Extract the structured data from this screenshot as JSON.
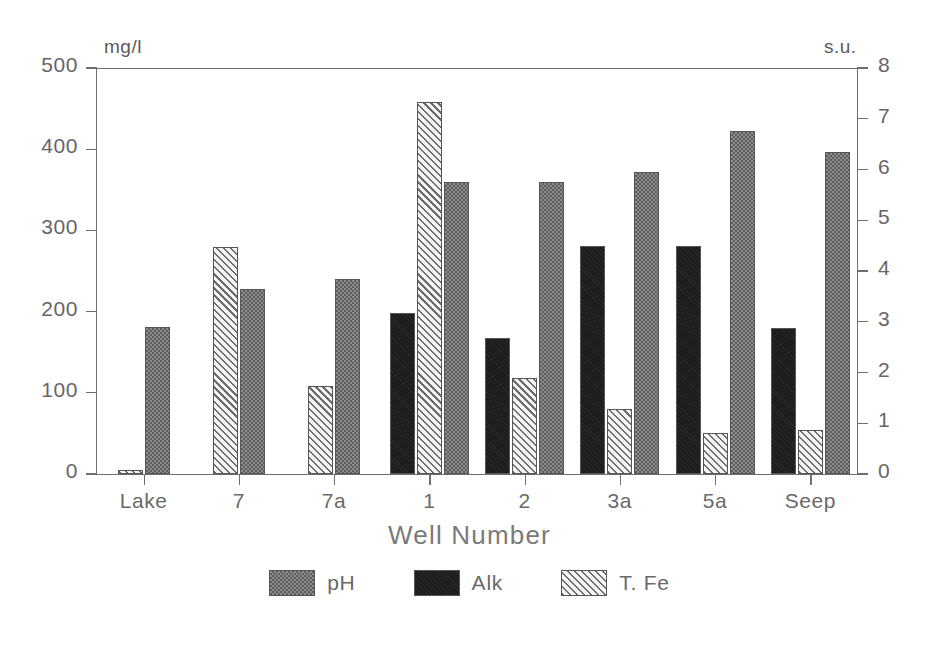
{
  "chart_data": {
    "type": "bar",
    "title": "",
    "xlabel": "Well Number",
    "left_axis": {
      "unit_label": "mg/l",
      "ticks": [
        0,
        100,
        200,
        300,
        400,
        500
      ],
      "ylim": [
        0,
        500
      ]
    },
    "right_axis": {
      "unit_label": "s.u.",
      "ticks": [
        0,
        1,
        2,
        3,
        4,
        5,
        6,
        7,
        8
      ],
      "ylim": [
        0,
        8
      ]
    },
    "grid": false,
    "legend_position": "bottom-center",
    "categories": [
      "Lake",
      "7",
      "7a",
      "1",
      "2",
      "3a",
      "5a",
      "Seep"
    ],
    "series": [
      {
        "name": "pH",
        "axis": "right",
        "unit": "s.u.",
        "pattern": "stipple-gray",
        "color": "#8d8d8d",
        "values": [
          2.9,
          3.65,
          3.85,
          5.75,
          5.75,
          5.95,
          6.75,
          6.35
        ]
      },
      {
        "name": "Alk",
        "axis": "left",
        "unit": "mg/l",
        "pattern": "solid-black",
        "color": "#1c1c1c",
        "values": [
          null,
          null,
          null,
          198,
          167,
          281,
          281,
          180
        ]
      },
      {
        "name": "T. Fe",
        "axis": "left",
        "unit": "mg/l",
        "pattern": "diagonal-hatch",
        "color": "#f2f2f2",
        "values": [
          5,
          279,
          108,
          458,
          118,
          80,
          51,
          54
        ]
      }
    ],
    "left_axis_equivalents_of_ph_bars": [
      181,
      228,
      241,
      359,
      359,
      372,
      421,
      396
    ]
  },
  "legend": {
    "items": [
      {
        "label": "pH",
        "pattern": "stipple-gray"
      },
      {
        "label": "Alk",
        "pattern": "solid-black"
      },
      {
        "label": "T. Fe",
        "pattern": "diagonal-hatch"
      }
    ]
  }
}
